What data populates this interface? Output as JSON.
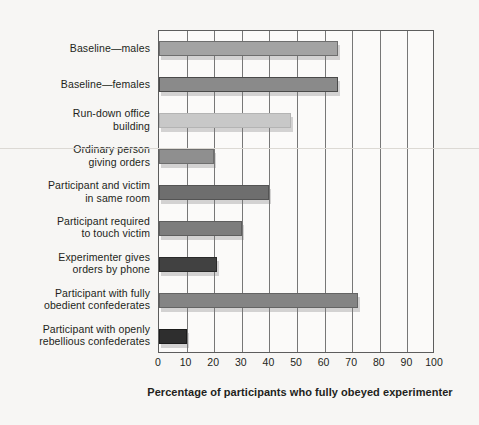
{
  "chart_data": {
    "type": "bar",
    "orientation": "horizontal",
    "title": "",
    "subtitle": "",
    "xlabel": "Percentage of participants who fully obeyed experimenter",
    "ylabel": "",
    "xlim": [
      0,
      100
    ],
    "xticks": [
      0,
      10,
      20,
      30,
      40,
      50,
      60,
      70,
      80,
      90,
      100
    ],
    "grid": "vertical",
    "legend": "none",
    "categories": [
      "Baseline—males",
      "Baseline—females",
      "Run-down office building",
      "Ordinary person giving orders",
      "Participant and victim in same room",
      "Participant required to touch victim",
      "Experimenter gives orders by phone",
      "Participant with fully obedient confederates",
      "Participant with openly rebellious confederates"
    ],
    "category_lines": [
      [
        "Baseline—males"
      ],
      [
        "Baseline—females"
      ],
      [
        "Run-down office",
        "building"
      ],
      [
        "Ordinary person",
        "giving orders"
      ],
      [
        "Participant and victim",
        "in same room"
      ],
      [
        "Participant required",
        "to touch victim"
      ],
      [
        "Experimenter gives",
        "orders by phone"
      ],
      [
        "Participant with fully",
        "obedient confederates"
      ],
      [
        "Participant with openly",
        "rebellious confederates"
      ]
    ],
    "values": [
      65,
      65,
      48,
      20,
      40,
      30,
      21,
      72,
      10
    ],
    "bar_colors": [
      "#a3a3a3",
      "#8a8a8a",
      "#c8c8c8",
      "#8f8f8f",
      "#6e6e6e",
      "#7d7d7d",
      "#414141",
      "#848484",
      "#2e2e2e"
    ],
    "bar_borders": [
      "#6e6e6e",
      "#4a4a4a",
      "#b4b4b4",
      "#6e6e6e",
      "#545454",
      "#5e5e5e",
      "#2a2a2a",
      "#646464",
      "#1c1c1c"
    ]
  },
  "figure": {
    "background_color": "#f7f6f4",
    "plot_background_color": "#fbfaf9",
    "axis_color": "#5d5d5d",
    "gridline_color": "#777777",
    "text_color": "#231f20"
  }
}
